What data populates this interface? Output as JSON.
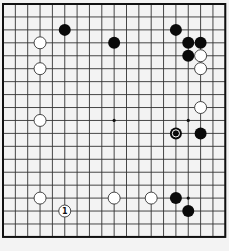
{
  "board": {
    "size": 19,
    "origin_x": 3,
    "origin_y": 4,
    "spacing_x": 12.35,
    "spacing_y": 12.94,
    "colors": {
      "background": "#f3f3f3",
      "line": "#333333",
      "black": "#0a0a0a",
      "white": "#ffffff"
    },
    "star_points": [
      [
        3,
        3
      ],
      [
        9,
        3
      ],
      [
        15,
        3
      ],
      [
        3,
        9
      ],
      [
        9,
        9
      ],
      [
        15,
        9
      ],
      [
        3,
        15
      ],
      [
        9,
        15
      ],
      [
        15,
        15
      ]
    ],
    "stones": [
      {
        "color": "black",
        "col": 5,
        "row": 2
      },
      {
        "color": "black",
        "col": 9,
        "row": 3
      },
      {
        "color": "black",
        "col": 14,
        "row": 2
      },
      {
        "color": "black",
        "col": 15,
        "row": 3
      },
      {
        "color": "black",
        "col": 16,
        "row": 3
      },
      {
        "color": "black",
        "col": 15,
        "row": 4
      },
      {
        "color": "white",
        "col": 16,
        "row": 4
      },
      {
        "color": "white",
        "col": 16,
        "row": 5
      },
      {
        "color": "white",
        "col": 3,
        "row": 3
      },
      {
        "color": "white",
        "col": 3,
        "row": 5
      },
      {
        "color": "white",
        "col": 3,
        "row": 9
      },
      {
        "color": "white",
        "col": 16,
        "row": 8
      },
      {
        "color": "black",
        "col": 14,
        "row": 10,
        "marker": "last-move"
      },
      {
        "color": "black",
        "col": 16,
        "row": 10
      },
      {
        "color": "white",
        "col": 3,
        "row": 15
      },
      {
        "color": "white",
        "col": 5,
        "row": 16,
        "label": "1"
      },
      {
        "color": "white",
        "col": 9,
        "row": 15
      },
      {
        "color": "white",
        "col": 12,
        "row": 15
      },
      {
        "color": "black",
        "col": 14,
        "row": 15
      },
      {
        "color": "black",
        "col": 15,
        "row": 16
      }
    ]
  }
}
